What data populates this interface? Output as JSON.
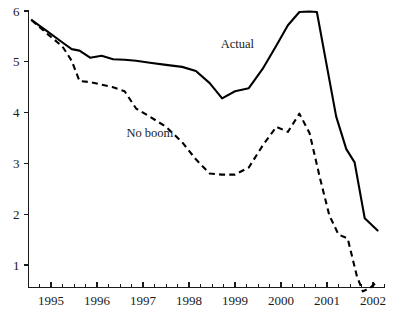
{
  "chart_data": {
    "type": "line",
    "title": "",
    "xlabel": "",
    "ylabel": "",
    "xlim": [
      1994.5,
      2002.25
    ],
    "ylim": [
      0.55,
      6.3
    ],
    "grid": false,
    "legend_position": "inline-annotations",
    "y_ticks": [
      1,
      2,
      3,
      4,
      5,
      6
    ],
    "y_tick_labels": [
      "1",
      "2",
      "3",
      "4",
      "5",
      "6"
    ],
    "x_ticks": [
      1995,
      1996,
      1997,
      1998,
      1999,
      2000,
      2001,
      2002
    ],
    "x_tick_labels": [
      "1995",
      "1996",
      "1997",
      "1998",
      "1999",
      "2000",
      "2001",
      "2002"
    ],
    "x_minor_ticks_per_interval": 4,
    "annotations": [
      {
        "text": "Actual",
        "x": 1999.05,
        "y": 5.28
      },
      {
        "text": "No boom",
        "x": 1997.15,
        "y": 3.52
      }
    ],
    "series": [
      {
        "name": "Actual",
        "style": "solid",
        "color": "#000000",
        "x": [
          1994.58,
          1994.92,
          1995.25,
          1995.45,
          1995.62,
          1995.85,
          1996.1,
          1996.35,
          1996.6,
          1996.85,
          1997.15,
          1997.5,
          1997.85,
          1998.15,
          1998.45,
          1998.72,
          1999.0,
          1999.3,
          1999.6,
          1999.9,
          2000.15,
          2000.4,
          2000.62,
          2000.78,
          2001.0,
          2001.2,
          2001.42,
          2001.6,
          2001.82,
          2002.1
        ],
        "y": [
          5.82,
          5.6,
          5.38,
          5.25,
          5.22,
          5.08,
          5.12,
          5.05,
          5.04,
          5.02,
          4.98,
          4.94,
          4.9,
          4.82,
          4.58,
          4.28,
          4.42,
          4.48,
          4.86,
          5.32,
          5.72,
          5.98,
          5.99,
          5.98,
          4.9,
          3.92,
          3.28,
          3.02,
          1.92,
          1.68
        ]
      },
      {
        "name": "No boom",
        "style": "dashed",
        "color": "#000000",
        "x": [
          1994.58,
          1994.92,
          1995.25,
          1995.45,
          1995.62,
          1995.85,
          1996.1,
          1996.35,
          1996.6,
          1996.85,
          1997.15,
          1997.5,
          1997.85,
          1998.15,
          1998.45,
          1998.72,
          1999.0,
          1999.3,
          1999.6,
          1999.9,
          2000.15,
          2000.4,
          2000.62,
          2000.85,
          2001.05,
          2001.25,
          2001.45,
          2001.65,
          2001.78,
          2001.95,
          2002.1
        ],
        "y": [
          5.82,
          5.55,
          5.3,
          5.02,
          4.62,
          4.6,
          4.55,
          4.5,
          4.42,
          4.08,
          3.92,
          3.72,
          3.42,
          3.08,
          2.8,
          2.78,
          2.78,
          2.92,
          3.35,
          3.72,
          3.62,
          3.98,
          3.6,
          2.7,
          1.98,
          1.6,
          1.52,
          0.78,
          0.48,
          0.56,
          0.68
        ]
      }
    ]
  }
}
